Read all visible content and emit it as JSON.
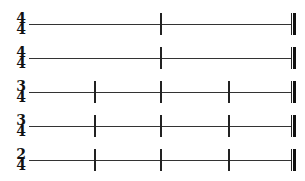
{
  "staves": [
    {
      "time_signature": {
        "top": "4",
        "bottom": "4"
      },
      "line_y": 24,
      "barlines_x": [
        160
      ]
    },
    {
      "time_signature": {
        "top": "4",
        "bottom": "4"
      },
      "line_y": 58,
      "barlines_x": [
        160
      ]
    },
    {
      "time_signature": {
        "top": "3",
        "bottom": "4"
      },
      "line_y": 92,
      "barlines_x": [
        94,
        160,
        228
      ]
    },
    {
      "time_signature": {
        "top": "3",
        "bottom": "4"
      },
      "line_y": 126,
      "barlines_x": [
        94,
        160,
        228
      ]
    },
    {
      "time_signature": {
        "top": "2",
        "bottom": "4"
      },
      "line_y": 160,
      "barlines_x": [
        94,
        160,
        228
      ]
    }
  ],
  "final_barline_x": 291,
  "colors": {
    "ink": "#111111",
    "line": "#333333",
    "background": "#ffffff"
  }
}
